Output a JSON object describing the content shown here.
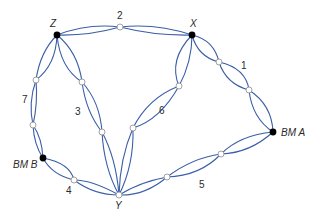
{
  "diagram": {
    "type": "level-network",
    "colors": {
      "line": "#3a5ea8",
      "benchmark": "#000000",
      "turning_point_fill": "#ffffff",
      "turning_point_stroke": "#888888"
    },
    "nodes": {
      "Z": {
        "label": "Z",
        "kind": "junction"
      },
      "X": {
        "label": "X",
        "kind": "junction"
      },
      "Y": {
        "label": "Y",
        "kind": "junction-open"
      },
      "BMA": {
        "label": "BM A",
        "kind": "benchmark"
      },
      "BMB": {
        "label": "BM B",
        "kind": "benchmark"
      }
    },
    "lines": [
      {
        "id": "1",
        "label": "1",
        "from": "X",
        "to": "BM A"
      },
      {
        "id": "2",
        "label": "2",
        "from": "Z",
        "to": "X"
      },
      {
        "id": "3",
        "label": "3",
        "from": "Z",
        "to": "Y"
      },
      {
        "id": "4",
        "label": "4",
        "from": "BM B",
        "to": "Y"
      },
      {
        "id": "5",
        "label": "5",
        "from": "Y",
        "to": "BM A"
      },
      {
        "id": "6",
        "label": "6",
        "from": "Y",
        "to": "X"
      },
      {
        "id": "7",
        "label": "7",
        "from": "Z",
        "to": "BM B"
      }
    ]
  }
}
